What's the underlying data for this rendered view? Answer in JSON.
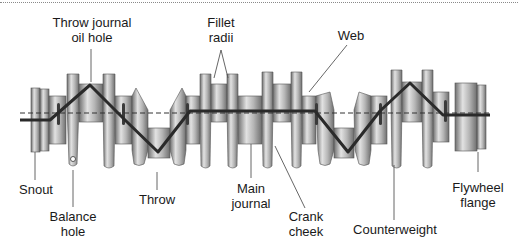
{
  "diagram": {
    "colors": {
      "metal_dark": "#6e6e6e",
      "metal_mid": "#a9a9a9",
      "metal_light": "#e2e2e2",
      "oil_path": "#2a2a2a",
      "leader": "#555555",
      "text": "#1a1a1a"
    },
    "labels": {
      "throw_journal_oil_hole": [
        "Throw journal",
        "oil hole"
      ],
      "fillet_radii": [
        "Fillet",
        "radii"
      ],
      "web": [
        "Web"
      ],
      "snout": [
        "Snout"
      ],
      "balance_hole": [
        "Balance",
        "hole"
      ],
      "throw": [
        "Throw"
      ],
      "main_journal": [
        "Main",
        "journal"
      ],
      "crank_cheek": [
        "Crank",
        "cheek"
      ],
      "counterweight": [
        "Counterweight"
      ],
      "flywheel_flange": [
        "Flywheel",
        "flange"
      ]
    }
  }
}
